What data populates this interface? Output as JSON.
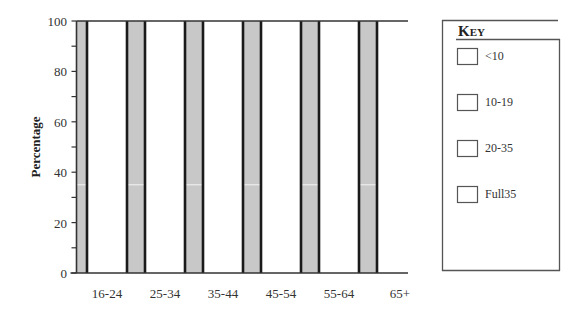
{
  "chart_data": {
    "type": "bar",
    "stacked": true,
    "title": "",
    "xlabel": "",
    "ylabel": "Percentage",
    "ylim": [
      0,
      100
    ],
    "yticks": [
      0,
      20,
      40,
      60,
      80,
      100
    ],
    "yminor_step": 10,
    "categories": [
      "16-24",
      "25-34",
      "35-44",
      "45-54",
      "55-64",
      "65+"
    ],
    "series": [
      {
        "name": "<10",
        "values": [
          null,
          null,
          null,
          null,
          null,
          null
        ]
      },
      {
        "name": "10-19",
        "values": [
          null,
          null,
          null,
          null,
          null,
          null
        ]
      },
      {
        "name": "20-35",
        "values": [
          null,
          null,
          null,
          null,
          null,
          null
        ]
      },
      {
        "name": "Full35",
        "values": [
          null,
          null,
          null,
          null,
          null,
          null
        ]
      }
    ],
    "bar_totals": [
      100,
      100,
      100,
      100,
      100,
      100
    ],
    "background_line_value": 35,
    "grid": false,
    "legend": {
      "title": "Key",
      "placement": "right",
      "entries": [
        "<10",
        "10-19",
        "20-35",
        "Full35"
      ]
    },
    "colors": {
      "bar_fill": "#ffffff",
      "bar_edge": "#1a1a1a",
      "plot_background": "#c8c8c8",
      "axis": "#333333"
    }
  }
}
